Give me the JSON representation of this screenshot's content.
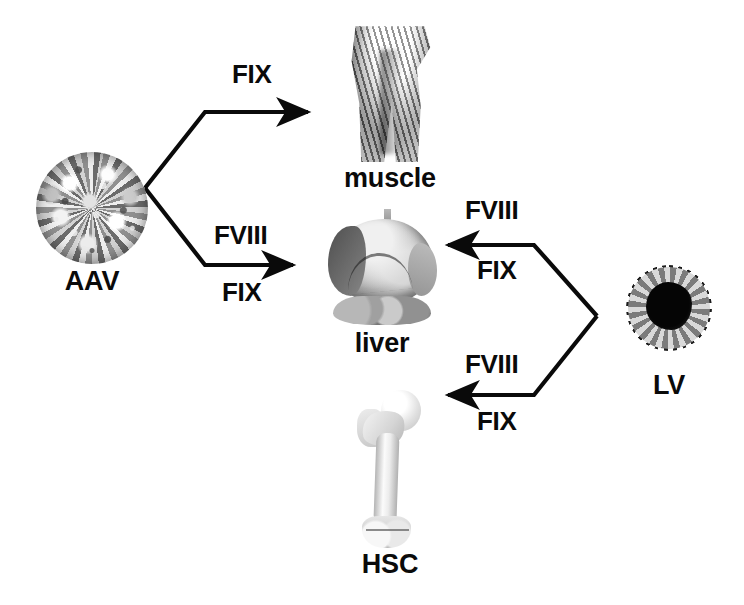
{
  "figure": {
    "background_color": "#ffffff",
    "line_color": "#0a0a0a"
  },
  "vectors": [
    {
      "id": "aav",
      "label": "AAV",
      "icon": "aav-capsid-icon"
    },
    {
      "id": "lv",
      "label": "LV",
      "icon": "lentivirus-particle-icon"
    }
  ],
  "tissues": [
    {
      "id": "muscle",
      "label": "muscle",
      "icon": "muscle-arm-image"
    },
    {
      "id": "liver",
      "label": "liver",
      "icon": "liver-organ-image"
    },
    {
      "id": "hsc",
      "label": "HSC",
      "icon": "femur-bone-image"
    }
  ],
  "edges": [
    {
      "id": "aav-to-muscle",
      "from": "AAV",
      "to": "muscle",
      "labels_above": [
        "FIX"
      ],
      "labels_below": []
    },
    {
      "id": "aav-to-liver",
      "from": "AAV",
      "to": "liver",
      "labels_above": [
        "FVIII"
      ],
      "labels_below": [
        "FIX"
      ]
    },
    {
      "id": "lv-to-liver",
      "from": "LV",
      "to": "liver",
      "labels_above": [
        "FVIII"
      ],
      "labels_below": [
        "FIX"
      ]
    },
    {
      "id": "lv-to-hsc",
      "from": "LV",
      "to": "HSC",
      "labels_above": [
        "FVIII"
      ],
      "labels_below": [
        "FIX"
      ]
    }
  ],
  "arrow_labels": {
    "aav_muscle_fix": "FIX",
    "aav_liver_fviii": "FVIII",
    "aav_liver_fix": "FIX",
    "lv_liver_fviii": "FVIII",
    "lv_liver_fix": "FIX",
    "lv_hsc_fviii": "FVIII",
    "lv_hsc_fix": "FIX"
  }
}
